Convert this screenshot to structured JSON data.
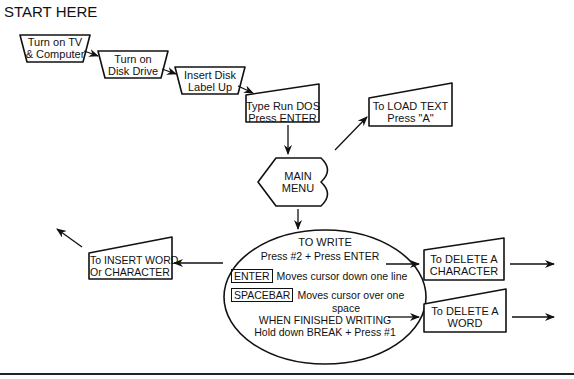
{
  "title": "START HERE",
  "steps": {
    "turn_on_tv": {
      "line1": "Turn on TV",
      "line2": "& Computer"
    },
    "turn_on_disk": {
      "line1": "Turn on",
      "line2": "Disk Drive"
    },
    "insert_disk": {
      "line1": "Insert Disk",
      "line2": "Label Up"
    },
    "type_run_dos": {
      "line1": "Type Run DOS",
      "line2": "Press ENTER"
    },
    "load_text": {
      "line1": "To LOAD TEXT",
      "line2": "Press \"A\""
    },
    "main_menu": {
      "line1": "MAIN",
      "line2": "MENU"
    }
  },
  "write_circle": {
    "title": "TO WRITE",
    "subtitle": "Press #2 + Press ENTER",
    "enter_key": "ENTER",
    "enter_desc": "Moves cursor down one line",
    "spacebar_key": "SPACEBAR",
    "spacebar_desc_line1": "Moves cursor over one",
    "spacebar_desc_line2": "space",
    "finish_line1": "WHEN FINISHED WRITING",
    "finish_line2": "Hold down BREAK + Press #1"
  },
  "branches": {
    "insert": {
      "line1": "To INSERT WORD",
      "line2": "Or CHARACTER"
    },
    "delete_char": {
      "line1": "To DELETE A",
      "line2": "CHARACTER"
    },
    "delete_word": {
      "line1": "To DELETE A",
      "line2": "WORD"
    }
  }
}
